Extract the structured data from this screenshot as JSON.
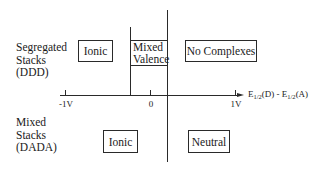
{
  "diagram": {
    "rows": [
      {
        "label_lines": [
          "Segregated",
          "Stacks",
          "(DDD)"
        ]
      },
      {
        "label_lines": [
          "Mixed",
          "Stacks",
          "(DADA)"
        ]
      }
    ],
    "regions_top": [
      {
        "label": "Ionic"
      },
      {
        "label_lines": [
          "Mixed",
          "Valence"
        ]
      },
      {
        "label": "No Complexes"
      }
    ],
    "regions_bottom": [
      {
        "label": "Ionic"
      },
      {
        "label": "Neutral"
      }
    ],
    "axis": {
      "ticks": [
        {
          "label": "-1V",
          "value": -1
        },
        {
          "label": "0",
          "value": 0
        },
        {
          "label": "1V",
          "value": 1
        }
      ],
      "label_parts": {
        "e1": "E",
        "sub1": "1/2",
        "mid": "(D) - E",
        "sub2": "1/2",
        "end": "(A)"
      }
    }
  }
}
